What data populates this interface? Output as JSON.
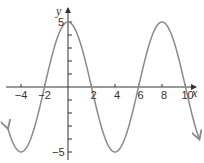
{
  "chart_data": {
    "type": "line",
    "title": "",
    "xlabel": "x",
    "ylabel": "y",
    "function": "y = 5cos(pi*x/4)",
    "xlim": [
      -5.2,
      11.2
    ],
    "ylim": [
      -5.2,
      5.2
    ],
    "x_ticks": [
      -4,
      -2,
      2,
      4,
      6,
      8,
      10
    ],
    "x_tick_labels": [
      "−4",
      "−2",
      "2",
      "4",
      "6",
      "8",
      "10"
    ],
    "y_ticks": [
      -5,
      -4,
      -3,
      -2,
      -1,
      1,
      2,
      3,
      4,
      5
    ],
    "y_tick_labels_shown": [
      "5",
      "−5"
    ],
    "grid": false,
    "series": [
      {
        "name": "curve",
        "color": "#8a8a8a",
        "x": [
          -5.2,
          -4,
          -2,
          0,
          2,
          4,
          6,
          8,
          10,
          11.2
        ],
        "y": [
          -4.0,
          -5,
          0,
          5,
          0,
          -5,
          0,
          5,
          0,
          -4.0
        ],
        "arrows_at_ends": true
      }
    ],
    "key_points": {
      "maxima": [
        [
          0,
          5
        ],
        [
          8,
          5
        ]
      ],
      "minima": [
        [
          -4,
          -5
        ],
        [
          4,
          -5
        ]
      ],
      "zeros": [
        -2,
        2,
        6,
        10
      ]
    }
  },
  "labels": {
    "x_axis": "x",
    "y_axis": "y",
    "y_max": "5",
    "y_min": "−5",
    "x_ticks": [
      "−4",
      "−2",
      "2",
      "4",
      "6",
      "8",
      "10"
    ]
  }
}
